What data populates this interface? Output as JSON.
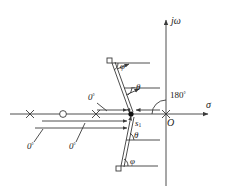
{
  "figure": {
    "kind": "root-locus-angle-condition-diagram",
    "axes": {
      "imaginary_label": "jω",
      "real_label": "σ",
      "origin_label": "O"
    },
    "test_point": {
      "label_base": "s",
      "label_sub": "1",
      "x": 131,
      "y": 114
    },
    "real_axis": {
      "y": 114,
      "x_start": 10,
      "x_end": 214
    },
    "imag_axis": {
      "x": 166,
      "y_start": 16,
      "y_end": 186
    },
    "markers": [
      {
        "type": "pole",
        "glyph": "×",
        "x": 30,
        "y": 114,
        "name": "pole-marker-1"
      },
      {
        "type": "zero",
        "glyph": "○",
        "x": 63,
        "y": 114,
        "name": "zero-marker-1"
      },
      {
        "type": "pole",
        "glyph": "×",
        "x": 96,
        "y": 114,
        "name": "pole-marker-2"
      },
      {
        "type": "pole",
        "glyph": "×",
        "x": 166,
        "y": 114,
        "name": "pole-marker-origin"
      },
      {
        "type": "zero",
        "glyph": "□",
        "x": 110,
        "y": 61,
        "name": "zero-marker-upper"
      },
      {
        "type": "zero",
        "glyph": "□",
        "x": 119,
        "y": 168,
        "name": "zero-marker-lower"
      }
    ],
    "angle_labels": {
      "zero_deg_upper": "0",
      "zero_deg_lower_left": "0",
      "zero_deg_lower_mid": "0",
      "degree_sign": "°",
      "minus_theta": "−θ",
      "theta": "θ",
      "phi_upper": "φ",
      "phi_lower": "φ",
      "one_eighty": "180",
      "one_eighty_sup": "°"
    },
    "colors": {
      "stroke": "#3a3a3a",
      "text": "#1a1a1a",
      "point_fill": "#111111",
      "background": "#ffffff"
    }
  }
}
